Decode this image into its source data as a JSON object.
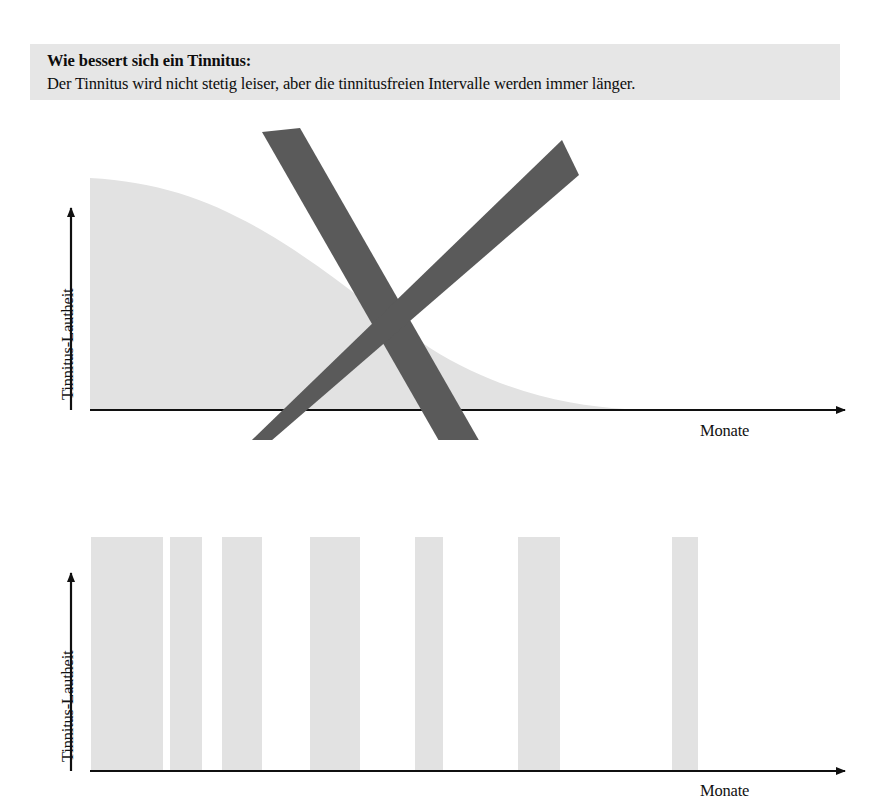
{
  "header": {
    "title": "Wie bessert sich ein Tinnitus:",
    "subtitle": "Der Tinnitus wird nicht stetig leiser, aber die tinnitusfreien Intervalle werden immer länger.",
    "background_color": "#e6e6e6",
    "text_color": "#0d0d0d"
  },
  "colors": {
    "area_fill": "#e2e2e2",
    "bar_fill": "#e2e2e2",
    "axis": "#101010",
    "cross_mark": "#5a5a5a",
    "page_background": "#ffffff"
  },
  "chart_data": [
    {
      "type": "area",
      "id": "wrong-model-decaying-loudness",
      "title": "",
      "xlabel": "Monate",
      "ylabel": "Tinnitus-Lautheit",
      "grid": false,
      "legend": null,
      "annotation": "cross-out-mark",
      "annotation_meaning": "Dieses Modell ist falsch (durchgestrichen)",
      "x": [
        0,
        1,
        2,
        3,
        4,
        5,
        6,
        7,
        8,
        9,
        10,
        11,
        12
      ],
      "values": [
        100,
        97,
        93,
        87,
        79,
        69,
        57,
        45,
        33,
        22,
        13,
        6,
        0
      ],
      "xlim": [
        0,
        14
      ],
      "ylim": [
        0,
        108
      ]
    },
    {
      "type": "bar",
      "id": "correct-model-tinnitus-free-intervals",
      "title": "",
      "xlabel": "Monate",
      "ylabel": "Tinnitus-Lautheit",
      "grid": false,
      "legend": null,
      "bar_note": "Alle Balken gleich hoch; Lücken (tinnitusfreie Intervalle) werden immer breiter.",
      "categories": [
        "1",
        "2",
        "3",
        "4",
        "5",
        "6",
        "7"
      ],
      "values": [
        100,
        100,
        100,
        100,
        100,
        100,
        100
      ],
      "bar_left_px": [
        91,
        170,
        222,
        310,
        415,
        518,
        672
      ],
      "bar_width_px": [
        72,
        32,
        40,
        50,
        28,
        42,
        26
      ],
      "xlim": [
        0,
        14
      ],
      "ylim": [
        0,
        108
      ]
    }
  ],
  "axes": {
    "y_title": "Tinnitus-Lautheit",
    "x_title": "Monate"
  }
}
